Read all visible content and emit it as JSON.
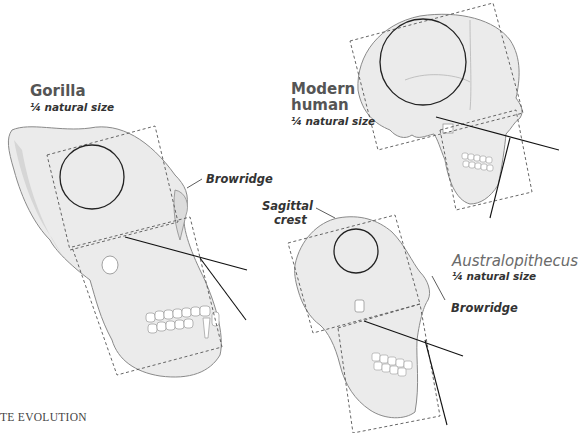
{
  "figure": {
    "specimens": [
      {
        "id": "gorilla",
        "name": "Gorilla",
        "scale": "¼ natural size",
        "callouts": [
          "Browridge"
        ]
      },
      {
        "id": "modern-human",
        "name_line1": "Modern",
        "name_line2": "human",
        "scale": "¼ natural size",
        "callouts": []
      },
      {
        "id": "australopithecus",
        "name": "Australopithecus",
        "scale": "¼ natural size",
        "callouts": [
          "Sagittal crest",
          "Browridge"
        ]
      }
    ],
    "sagittal_line1": "Sagittal",
    "sagittal_line2": "crest",
    "footer_text": "TE EVOLUTION",
    "colors": {
      "bone_fill": "#ececec",
      "bone_shadow": "#d4d4d4",
      "outline": "#8a8a8a",
      "dashed_box": "#555555",
      "circle": "#222222",
      "axis_line": "#111111",
      "label_gray": "#555555"
    }
  }
}
